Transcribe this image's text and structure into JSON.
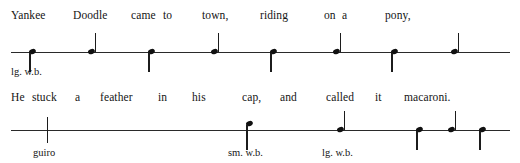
{
  "figure": {
    "type": "percussion-rhythm-notation",
    "title_text": "",
    "ink_color": "#141414",
    "staff_color": "#2a2a2a"
  },
  "systems": [
    {
      "id": "system-1",
      "lyrics": [
        {
          "text": "Yankee",
          "x": 11
        },
        {
          "text": "Doodle",
          "x": 73
        },
        {
          "text": "came",
          "x": 131
        },
        {
          "text": "to",
          "x": 163
        },
        {
          "text": "town,",
          "x": 202
        },
        {
          "text": "riding",
          "x": 260
        },
        {
          "text": "on",
          "x": 324
        },
        {
          "text": "a",
          "x": 342
        },
        {
          "text": "pony,",
          "x": 385
        }
      ],
      "staff": {
        "x": 11,
        "width": 499,
        "y": 52
      },
      "notes": [
        {
          "x": 33,
          "stem": "down",
          "head": "on-line"
        },
        {
          "x": 92,
          "stem": "up",
          "head": "on-line"
        },
        {
          "x": 152,
          "stem": "down",
          "head": "on-line"
        },
        {
          "x": 215,
          "stem": "up",
          "head": "on-line"
        },
        {
          "x": 274,
          "stem": "down",
          "head": "on-line"
        },
        {
          "x": 337,
          "stem": "up",
          "head": "on-line"
        },
        {
          "x": 395,
          "stem": "down",
          "head": "on-line"
        },
        {
          "x": 455,
          "stem": "up",
          "head": "on-line"
        }
      ],
      "instrument_labels": [
        {
          "text": "lg.  w.b.",
          "x": 11,
          "y": 66
        }
      ]
    },
    {
      "id": "system-2",
      "lyrics": [
        {
          "text": "He",
          "x": 11
        },
        {
          "text": "stuck",
          "x": 32
        },
        {
          "text": "a",
          "x": 75
        },
        {
          "text": "feather",
          "x": 100
        },
        {
          "text": "in",
          "x": 158
        },
        {
          "text": "his",
          "x": 192
        },
        {
          "text": "cap,",
          "x": 242
        },
        {
          "text": "and",
          "x": 280
        },
        {
          "text": "called",
          "x": 326
        },
        {
          "text": "it",
          "x": 375
        },
        {
          "text": "macaroni.",
          "x": 404
        }
      ],
      "staff": {
        "x": 11,
        "width": 499,
        "y": 130
      },
      "notes": [
        {
          "x": 250,
          "stem": "down",
          "head": "above-line"
        },
        {
          "x": 341,
          "stem": "up",
          "head": "on-line"
        },
        {
          "x": 420,
          "stem": "down",
          "head": "on-line"
        },
        {
          "x": 452,
          "stem": "up",
          "head": "on-line"
        },
        {
          "x": 483,
          "stem": "down",
          "head": "on-line"
        }
      ],
      "scrapes": [
        {
          "x": 47,
          "y": 117,
          "height": 26
        }
      ],
      "instrument_labels": [
        {
          "text": "guiro",
          "x": 33,
          "y": 147
        },
        {
          "text": "sm.  w.b.",
          "x": 228,
          "y": 147
        },
        {
          "text": "lg.  w.b.",
          "x": 322,
          "y": 147
        }
      ]
    }
  ]
}
